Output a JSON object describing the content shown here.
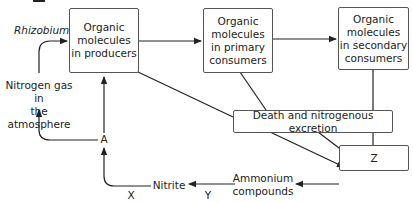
{
  "diagram": {
    "type": "nitrogen-cycle-flowchart",
    "boxes": {
      "producers": "Organic molecules in producers",
      "primary": "Organic molecules in primary consumers",
      "secondary": "Organic molecules in secondary consumers",
      "death": "Death and nitrogenous excretion",
      "z": "Z"
    },
    "labels": {
      "rhizobium": "Rhizobium",
      "nitrogen_gas_line1": "Nitrogen gas in",
      "nitrogen_gas_line2": "the atmosphere",
      "a": "A",
      "nitrite": "Nitrite",
      "ammonium_line1": "Ammonium",
      "ammonium_line2": "compounds",
      "x": "X",
      "y": "Y"
    },
    "producers_lines": [
      "Organic",
      "molecules",
      "in producers"
    ],
    "primary_lines": [
      "Organic",
      "molecules",
      "in primary",
      "consumers"
    ],
    "secondary_lines": [
      "Organic",
      "molecules",
      "in secondary",
      "consumers"
    ],
    "edges": [
      {
        "from": "Nitrogen gas in the atmosphere",
        "to": "Organic molecules in producers",
        "label": "Rhizobium"
      },
      {
        "from": "Organic molecules in producers",
        "to": "Organic molecules in primary consumers"
      },
      {
        "from": "Organic molecules in primary consumers",
        "to": "Organic molecules in secondary consumers"
      },
      {
        "from": "Organic molecules in producers",
        "to": "Z"
      },
      {
        "from": "Organic molecules in primary consumers",
        "to": "Z"
      },
      {
        "from": "Organic molecules in secondary consumers",
        "to": "Z"
      },
      {
        "from": "Z",
        "to": "Ammonium compounds"
      },
      {
        "from": "Ammonium compounds",
        "to": "Nitrite",
        "label": "Y"
      },
      {
        "from": "Nitrite",
        "to": "A",
        "label": "X"
      },
      {
        "from": "A",
        "to": "Organic molecules in producers"
      },
      {
        "from": "A",
        "to": "Nitrogen gas in the atmosphere"
      }
    ],
    "colors": {
      "line": "#222222",
      "box_border": "#555555",
      "background": "#ffffff"
    }
  }
}
